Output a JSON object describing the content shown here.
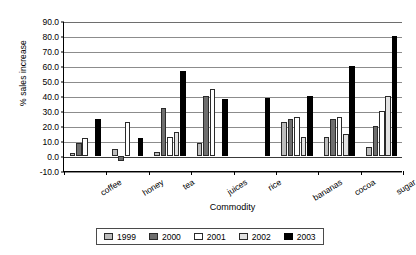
{
  "chart_data": {
    "type": "bar",
    "title": "",
    "xlabel": "Commodity",
    "ylabel": "% sales increase",
    "categories": [
      "coffee",
      "honey",
      "tea",
      "juices",
      "rice",
      "bananas",
      "cocoa",
      "sugar"
    ],
    "series": [
      {
        "name": "1999",
        "color": "#bdbdbd",
        "values": [
          2,
          5,
          3,
          9,
          0,
          23,
          13,
          6
        ]
      },
      {
        "name": "2000",
        "color": "#6e6e6e",
        "values": [
          9,
          -3,
          32,
          40,
          0,
          25,
          25,
          20
        ]
      },
      {
        "name": "2001",
        "color": "#ffffff",
        "values": [
          12,
          23,
          13,
          45,
          0,
          26,
          26,
          30
        ]
      },
      {
        "name": "2002",
        "color": "#e2e2e2",
        "values": [
          0,
          0,
          16,
          0,
          0,
          13,
          15,
          40
        ]
      },
      {
        "name": "2003",
        "color": "#000000",
        "values": [
          25,
          12,
          57,
          38,
          39,
          40,
          60,
          80
        ]
      }
    ],
    "ylim": [
      -10,
      90
    ],
    "ytick_labels": [
      "90.0",
      "80.0",
      "70.0",
      "60.0",
      "50.0",
      "40.0",
      "30.0",
      "20.0",
      "10.0",
      "0.0",
      "-10.0"
    ],
    "ytick_values": [
      90,
      80,
      70,
      60,
      50,
      40,
      30,
      20,
      10,
      0,
      -10
    ],
    "grid": true,
    "legend_position": "bottom"
  }
}
